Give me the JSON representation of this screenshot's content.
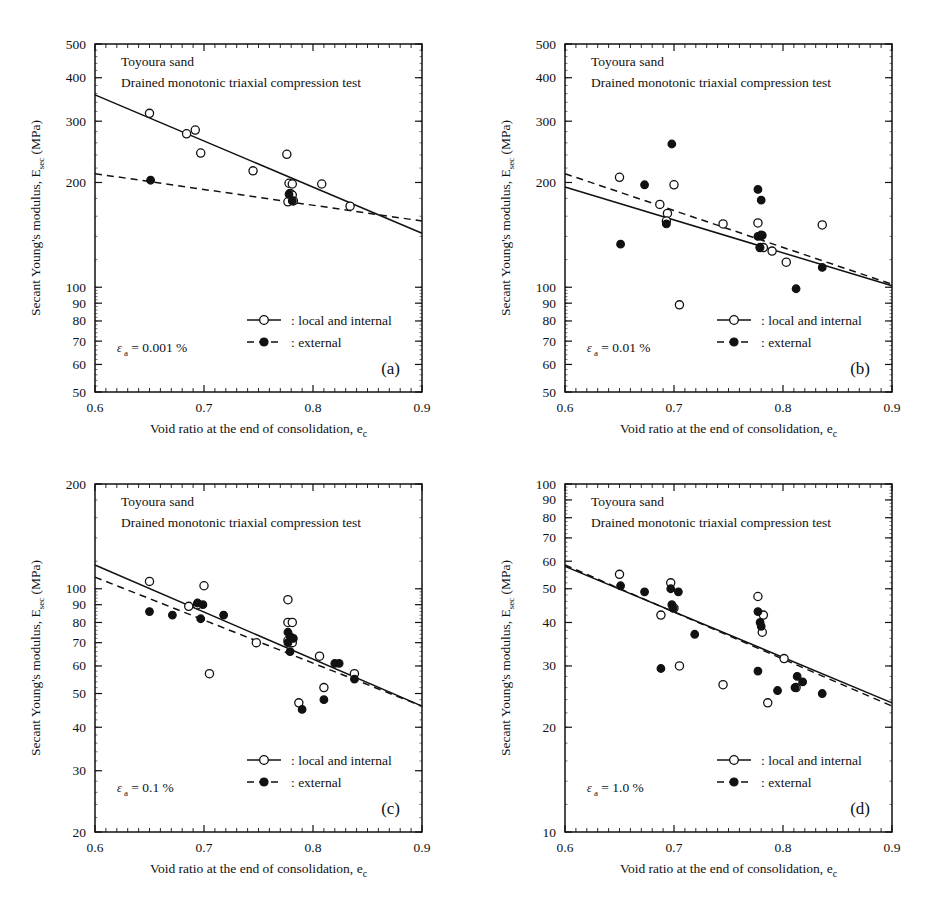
{
  "figure": {
    "xlabel": "Void ratio at the end of consolidation,",
    "xlabel_sub_main": "e",
    "xlabel_sub": "c",
    "ylabel_main": "Secant Young's modulus,",
    "ylabel_sym": "E",
    "ylabel_sym_sub": "sec",
    "ylabel_unit": "(MPa)",
    "legend_open": ": local and internal",
    "legend_filled": ": external",
    "material": "Toyoura sand",
    "test": "Drained monotonic triaxial compression test",
    "colors": {
      "ink": "#111111",
      "background": "#ffffff"
    }
  },
  "chart_data": [
    {
      "type": "scatter",
      "panel": "(a)",
      "title": "Toyoura sand",
      "subtitle": "Drained monotonic triaxial compression test",
      "annotation_eps": "ε",
      "annotation_eps_sub": "a",
      "annotation_value": "= 0.001 %",
      "xlabel": "Void ratio at the end of consolidation,  e_c",
      "ylabel": "Secant Young's modulus,  E_sec  (MPa)",
      "xlim": [
        0.6,
        0.9
      ],
      "ylim": [
        50,
        500
      ],
      "yscale": "log",
      "xticks": [
        0.6,
        0.7,
        0.8,
        0.9
      ],
      "xticklabels": [
        "0.6",
        "0.7",
        "0.8",
        "0.9"
      ],
      "yticks": [
        50,
        60,
        70,
        80,
        90,
        100,
        200,
        300,
        400,
        500
      ],
      "yticklabels": [
        "50",
        "60",
        "70",
        "80",
        "90",
        "100",
        "200",
        "300",
        "400",
        "500"
      ],
      "grid": false,
      "legend_position": "lower-right",
      "series": [
        {
          "name": "local and internal",
          "marker": "open-circle",
          "points": [
            [
              0.65,
              316
            ],
            [
              0.684,
              276
            ],
            [
              0.692,
              283
            ],
            [
              0.697,
              243
            ],
            [
              0.745,
              216
            ],
            [
              0.776,
              241
            ],
            [
              0.778,
              199
            ],
            [
              0.781,
              198
            ],
            [
              0.779,
              186
            ],
            [
              0.781,
              184
            ],
            [
              0.777,
              176
            ],
            [
              0.782,
              177
            ],
            [
              0.808,
              198
            ],
            [
              0.834,
              171
            ]
          ],
          "fit": {
            "x": [
              0.6,
              0.9
            ],
            "y": [
              357,
              143
            ],
            "style": "solid"
          }
        },
        {
          "name": "external",
          "marker": "filled-circle",
          "points": [
            [
              0.651,
              203
            ],
            [
              0.778,
              185
            ],
            [
              0.781,
              177
            ]
          ],
          "fit": {
            "x": [
              0.6,
              0.9
            ],
            "y": [
              212,
              155
            ],
            "style": "dashed"
          }
        }
      ]
    },
    {
      "type": "scatter",
      "panel": "(b)",
      "title": "Toyoura sand",
      "subtitle": "Drained monotonic triaxial compression test",
      "annotation_eps": "ε",
      "annotation_eps_sub": "a",
      "annotation_value": "= 0.01 %",
      "xlabel": "Void ratio at the end of consolidation,  e_c",
      "ylabel": "Secant Young's modulus,  E_sec  (MPa)",
      "xlim": [
        0.6,
        0.9
      ],
      "ylim": [
        50,
        500
      ],
      "yscale": "log",
      "xticks": [
        0.6,
        0.7,
        0.8,
        0.9
      ],
      "xticklabels": [
        "0.6",
        "0.7",
        "0.8",
        "0.9"
      ],
      "yticks": [
        50,
        60,
        70,
        80,
        90,
        100,
        200,
        300,
        400,
        500
      ],
      "yticklabels": [
        "50",
        "60",
        "70",
        "80",
        "90",
        "100",
        "200",
        "300",
        "400",
        "500"
      ],
      "grid": false,
      "legend_position": "lower-right",
      "series": [
        {
          "name": "local and internal",
          "marker": "open-circle",
          "points": [
            [
              0.65,
              207
            ],
            [
              0.7,
              197
            ],
            [
              0.687,
              173
            ],
            [
              0.694,
              163
            ],
            [
              0.693,
              155
            ],
            [
              0.745,
              152
            ],
            [
              0.777,
              153
            ],
            [
              0.78,
              141
            ],
            [
              0.779,
              130
            ],
            [
              0.782,
              130
            ],
            [
              0.79,
              127
            ],
            [
              0.803,
              118
            ],
            [
              0.836,
              151
            ],
            [
              0.705,
              89
            ]
          ],
          "fit": {
            "x": [
              0.6,
              0.9
            ],
            "y": [
              194,
              101
            ],
            "style": "solid"
          }
        },
        {
          "name": "external",
          "marker": "filled-circle",
          "points": [
            [
              0.698,
              258
            ],
            [
              0.673,
              197
            ],
            [
              0.777,
              191
            ],
            [
              0.78,
              178
            ],
            [
              0.693,
              152
            ],
            [
              0.651,
              133
            ],
            [
              0.777,
              140
            ],
            [
              0.781,
              141
            ],
            [
              0.779,
              130
            ],
            [
              0.812,
              99
            ],
            [
              0.836,
              114
            ]
          ],
          "fit": {
            "x": [
              0.6,
              0.9
            ],
            "y": [
              212,
              102
            ],
            "style": "dashed"
          }
        }
      ]
    },
    {
      "type": "scatter",
      "panel": "(c)",
      "title": "Toyoura sand",
      "subtitle": "Drained monotonic triaxial compression test",
      "annotation_eps": "ε",
      "annotation_eps_sub": "a",
      "annotation_value": "= 0.1 %",
      "xlabel": "Void ratio at the end of consolidation,  e_c",
      "ylabel": "Secant Young's modulus,  E_sec  (MPa)",
      "xlim": [
        0.6,
        0.9
      ],
      "ylim": [
        20,
        200
      ],
      "yscale": "log",
      "xticks": [
        0.6,
        0.7,
        0.8,
        0.9
      ],
      "xticklabels": [
        "0.6",
        "0.7",
        "0.8",
        "0.9"
      ],
      "yticks": [
        20,
        30,
        40,
        50,
        60,
        70,
        80,
        90,
        100,
        200
      ],
      "yticklabels": [
        "20",
        "30",
        "40",
        "50",
        "60",
        "70",
        "80",
        "90",
        "100",
        "200"
      ],
      "grid": false,
      "legend_position": "lower-right",
      "series": [
        {
          "name": "local and internal",
          "marker": "open-circle",
          "points": [
            [
              0.65,
              105
            ],
            [
              0.7,
              102
            ],
            [
              0.686,
              89
            ],
            [
              0.694,
              90
            ],
            [
              0.748,
              70
            ],
            [
              0.777,
              93
            ],
            [
              0.777,
              80
            ],
            [
              0.781,
              80
            ],
            [
              0.777,
              71
            ],
            [
              0.781,
              70
            ],
            [
              0.806,
              64
            ],
            [
              0.838,
              57
            ],
            [
              0.705,
              57
            ],
            [
              0.81,
              52
            ],
            [
              0.787,
              47
            ]
          ],
          "fit": {
            "x": [
              0.6,
              0.9
            ],
            "y": [
              117,
              46
            ],
            "style": "solid"
          }
        },
        {
          "name": "external",
          "marker": "filled-circle",
          "points": [
            [
              0.65,
              86
            ],
            [
              0.671,
              84
            ],
            [
              0.694,
              91
            ],
            [
              0.699,
              90
            ],
            [
              0.697,
              82
            ],
            [
              0.718,
              84
            ],
            [
              0.777,
              75
            ],
            [
              0.779,
              73
            ],
            [
              0.782,
              72
            ],
            [
              0.777,
              70
            ],
            [
              0.779,
              66
            ],
            [
              0.82,
              61
            ],
            [
              0.824,
              61
            ],
            [
              0.838,
              55
            ],
            [
              0.81,
              48
            ],
            [
              0.79,
              45
            ]
          ],
          "fit": {
            "x": [
              0.6,
              0.9
            ],
            "y": [
              108,
              46
            ],
            "style": "dashed"
          }
        }
      ]
    },
    {
      "type": "scatter",
      "panel": "(d)",
      "title": "Toyoura sand",
      "subtitle": "Drained monotonic triaxial compression test",
      "annotation_eps": "ε",
      "annotation_eps_sub": "a",
      "annotation_value": "= 1.0 %",
      "xlabel": "Void ratio at the end of consolidation,  e_c",
      "ylabel": "Secant Young's modulus,  E_sec  (MPa)",
      "xlim": [
        0.6,
        0.9
      ],
      "ylim": [
        10,
        100
      ],
      "yscale": "log",
      "xticks": [
        0.6,
        0.7,
        0.8,
        0.9
      ],
      "xticklabels": [
        "0.6",
        "0.7",
        "0.8",
        "0.9"
      ],
      "yticks": [
        10,
        20,
        30,
        40,
        50,
        60,
        70,
        80,
        90,
        100
      ],
      "yticklabels": [
        "10",
        "20",
        "30",
        "40",
        "50",
        "60",
        "70",
        "80",
        "90",
        "100"
      ],
      "grid": false,
      "legend_position": "lower-right",
      "series": [
        {
          "name": "local and internal",
          "marker": "open-circle",
          "points": [
            [
              0.65,
              55
            ],
            [
              0.697,
              52
            ],
            [
              0.688,
              42
            ],
            [
              0.7,
              44
            ],
            [
              0.777,
              47.5
            ],
            [
              0.782,
              42
            ],
            [
              0.781,
              37.5
            ],
            [
              0.705,
              30
            ],
            [
              0.745,
              26.5
            ],
            [
              0.801,
              31.5
            ],
            [
              0.812,
              26
            ],
            [
              0.786,
              23.5
            ]
          ],
          "fit": {
            "x": [
              0.6,
              0.9
            ],
            "y": [
              58,
              23.5
            ],
            "style": "solid"
          }
        },
        {
          "name": "external",
          "marker": "filled-circle",
          "points": [
            [
              0.651,
              51
            ],
            [
              0.673,
              49
            ],
            [
              0.697,
              50
            ],
            [
              0.704,
              49
            ],
            [
              0.698,
              45
            ],
            [
              0.699,
              44
            ],
            [
              0.719,
              37
            ],
            [
              0.777,
              43
            ],
            [
              0.779,
              40
            ],
            [
              0.78,
              39
            ],
            [
              0.688,
              29.5
            ],
            [
              0.777,
              29
            ],
            [
              0.795,
              25.5
            ],
            [
              0.813,
              28
            ],
            [
              0.818,
              27
            ],
            [
              0.811,
              26
            ],
            [
              0.836,
              25
            ]
          ],
          "fit": {
            "x": [
              0.6,
              0.9
            ],
            "y": [
              58.5,
              23
            ],
            "style": "dashed"
          }
        }
      ]
    }
  ]
}
